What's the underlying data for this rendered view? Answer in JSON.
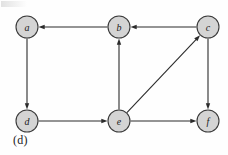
{
  "figure": {
    "caption": "(d)",
    "type": "directed-graph",
    "background_color": "#fefefe"
  },
  "style": {
    "node_fill": "#d4d4d4",
    "node_stroke": "#3a3a3a",
    "edge_color": "#2b2b2b",
    "label_color": "#1a1a1a",
    "node_radius": 11
  },
  "graph": {
    "nodes": [
      {
        "id": "a",
        "label": "a",
        "cx": 27,
        "cy": 27
      },
      {
        "id": "b",
        "label": "b",
        "cx": 119,
        "cy": 27
      },
      {
        "id": "c",
        "label": "c",
        "cx": 208,
        "cy": 27
      },
      {
        "id": "d",
        "label": "d",
        "cx": 27,
        "cy": 121
      },
      {
        "id": "e",
        "label": "e",
        "cx": 119,
        "cy": 121
      },
      {
        "id": "f",
        "label": "f",
        "cx": 208,
        "cy": 121
      }
    ],
    "edges": [
      {
        "from": "b",
        "to": "a",
        "directed": true
      },
      {
        "from": "c",
        "to": "b",
        "directed": true
      },
      {
        "from": "a",
        "to": "d",
        "directed": true
      },
      {
        "from": "e",
        "to": "b",
        "directed": true
      },
      {
        "from": "e",
        "to": "c",
        "directed": true
      },
      {
        "from": "d",
        "to": "e",
        "directed": true
      },
      {
        "from": "e",
        "to": "f",
        "directed": true
      },
      {
        "from": "c",
        "to": "f",
        "directed": true
      }
    ]
  }
}
